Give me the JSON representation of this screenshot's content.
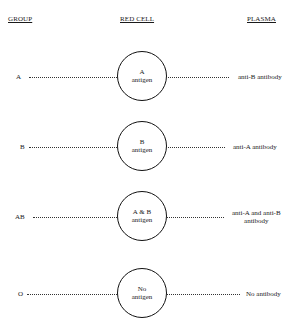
{
  "headers": {
    "group": "GROUP",
    "red_cell": "RED CELL",
    "plasma": "PLASMA"
  },
  "rows": [
    {
      "group": "A",
      "antigen_line1": "A",
      "antigen_line2": "antigen",
      "plasma_line1": "anti-B  antibody",
      "plasma_line2": ""
    },
    {
      "group": "B",
      "antigen_line1": "B",
      "antigen_line2": "antigen",
      "plasma_line1": "anti-A  antibody",
      "plasma_line2": ""
    },
    {
      "group": "AB",
      "antigen_line1": "A & B",
      "antigen_line2": "antigen",
      "plasma_line1": "anti-A and anti-B",
      "plasma_line2": "antibody"
    },
    {
      "group": "O",
      "antigen_line1": "No",
      "antigen_line2": "antigen",
      "plasma_line1": "No antibody",
      "plasma_line2": ""
    }
  ]
}
